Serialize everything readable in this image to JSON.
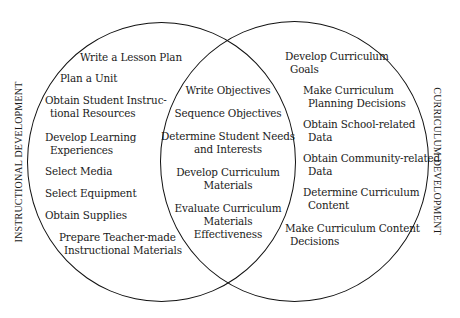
{
  "diagram": {
    "type": "venn",
    "sets": [
      {
        "id": "left",
        "label": "INSTRUCTIONAL DEVELOPMENT",
        "items": [
          {
            "line1": "Write a Lesson Plan"
          },
          {
            "line1": "Plan a Unit"
          },
          {
            "line1": "Obtain Student Instruc-",
            "line2": "tional Resources"
          },
          {
            "line1": "Develop Learning",
            "line2": "Experiences"
          },
          {
            "line1": "Select Media"
          },
          {
            "line1": "Select Equipment"
          },
          {
            "line1": "Obtain Supplies"
          },
          {
            "line1": "Prepare Teacher-made",
            "line2": "Instructional Materials"
          }
        ]
      },
      {
        "id": "right",
        "label": "CURRICULUM DEVELOPMENT",
        "items": [
          {
            "line1": "Develop Curriculum",
            "line2": "Goals"
          },
          {
            "line1": "Make Curriculum",
            "line2": "Planning Decisions"
          },
          {
            "line1": "Obtain School-related",
            "line2": "Data"
          },
          {
            "line1": "Obtain Community-related",
            "line2": "Data"
          },
          {
            "line1": "Determine Curriculum",
            "line2": "Content"
          },
          {
            "line1": "Make Curriculum Content",
            "line2": "Decisions"
          }
        ]
      }
    ],
    "intersection": {
      "items": [
        {
          "lines": [
            "Write Objectives"
          ]
        },
        {
          "lines": [
            "Sequence Objectives"
          ]
        },
        {
          "lines": [
            "Determine Student Needs",
            "and Interests"
          ]
        },
        {
          "lines": [
            "Develop Curriculum",
            "Materials"
          ]
        },
        {
          "lines": [
            "Evaluate Curriculum",
            "Materials",
            "Effectiveness"
          ]
        }
      ]
    },
    "colors": {
      "line": "#111111",
      "text": "#1a1a1a",
      "background": "#ffffff"
    }
  }
}
